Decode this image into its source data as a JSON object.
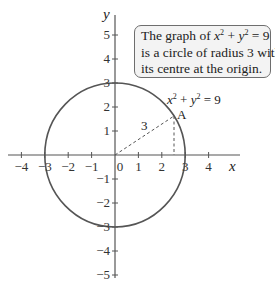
{
  "diagram": {
    "axes": {
      "x_label": "x",
      "y_label": "y",
      "x_ticks": [
        "−4",
        "−3",
        "−2",
        "−1",
        "0",
        "1",
        "2",
        "3",
        "4"
      ],
      "y_ticks_pos": [
        "5",
        "4",
        "3",
        "2",
        "1"
      ],
      "y_ticks_neg": [
        "−1",
        "−2",
        "−3",
        "−4",
        "−5"
      ]
    },
    "curve": {
      "label_x": "x",
      "label_sup1": "2",
      "label_plus": " + ",
      "label_y": "y",
      "label_sup2": "2",
      "label_rhs": " = 9",
      "radius": 3,
      "color": "#555555"
    },
    "point": {
      "label": "A",
      "radius_label": "3"
    },
    "callout": {
      "line1_pre": "The graph of ",
      "line1_x": "x",
      "line1_sup1": "2",
      "line1_plus": " + ",
      "line1_y": "y",
      "line1_sup2": "2",
      "line1_rhs": " = 9",
      "line2": "is a circle of radius 3 with",
      "line3": "its centre at the origin."
    }
  }
}
